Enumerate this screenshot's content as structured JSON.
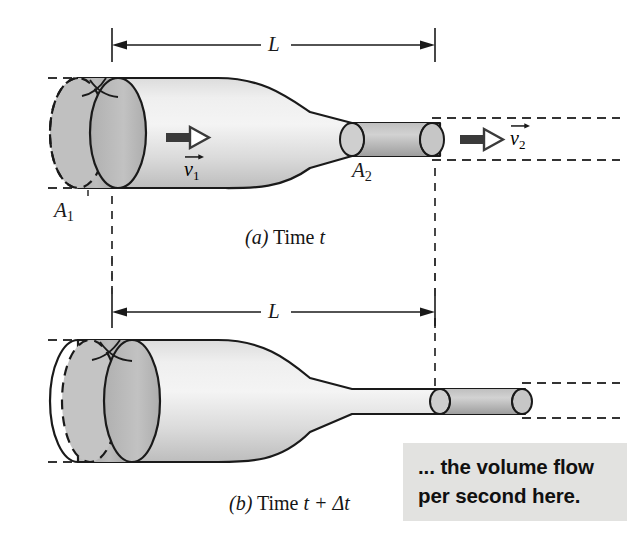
{
  "figure": {
    "kind": "physics-diagram",
    "background_color": "#ffffff",
    "ink_color": "#1a1a1a"
  },
  "panels": [
    {
      "id": "a",
      "caption_marker": "(a)",
      "caption_text": "Time",
      "caption_var": "t",
      "caption_full": "(a) Time t",
      "dimension_label": "L",
      "labels": {
        "area_left": "A",
        "area_left_sub": "1",
        "area_right": "A",
        "area_right_sub": "2",
        "velocity_left": "v",
        "velocity_left_sub": "1",
        "velocity_right": "v",
        "velocity_right_sub": "2"
      }
    },
    {
      "id": "b",
      "caption_marker": "(b)",
      "caption_text": "Time",
      "caption_var": "t + Δt",
      "caption_full": "(b) Time t + Δt",
      "dimension_label": "L",
      "labels": {}
    }
  ],
  "callout": {
    "line1": "... the volume flow",
    "line2": "per second here.",
    "full_text": "... the volume flow per second here.",
    "background_color": "#e2e2e0",
    "text_color": "#101010"
  },
  "colors": {
    "tube_fill_light": "#f2f2f2",
    "tube_fill_mid": "#d6d6d6",
    "tube_fill_dark": "#b4b4b4",
    "slab_fill": "#b9b9b9",
    "slab_fill_dark": "#a6a6a6",
    "outline": "#1a1a1a",
    "dash_color": "#333333",
    "callout_bg": "#e2e2e0"
  },
  "geometry": {
    "L_start_x": 112,
    "L_end_x": 435,
    "panel_a_axis_y": 130,
    "panel_b_axis_y": 398
  }
}
